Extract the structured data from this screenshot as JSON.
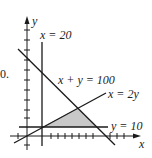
{
  "problem_number": "0.",
  "axes": {
    "x_label": "x",
    "y_label": "y"
  },
  "lines": [
    {
      "id": "x20",
      "label": "x = 20"
    },
    {
      "id": "xy100",
      "label": "x + y = 100"
    },
    {
      "id": "x2y",
      "label": "x = 2y"
    },
    {
      "id": "y10",
      "label": "y = 10"
    }
  ],
  "feasible_region": {
    "fill": "#c8c8c8",
    "description": "shaded triangle bounded by x = 2y, x + y = 100, y = 10"
  },
  "colors": {
    "line": "#1a1a1a",
    "shade": "#c8c8c8"
  }
}
